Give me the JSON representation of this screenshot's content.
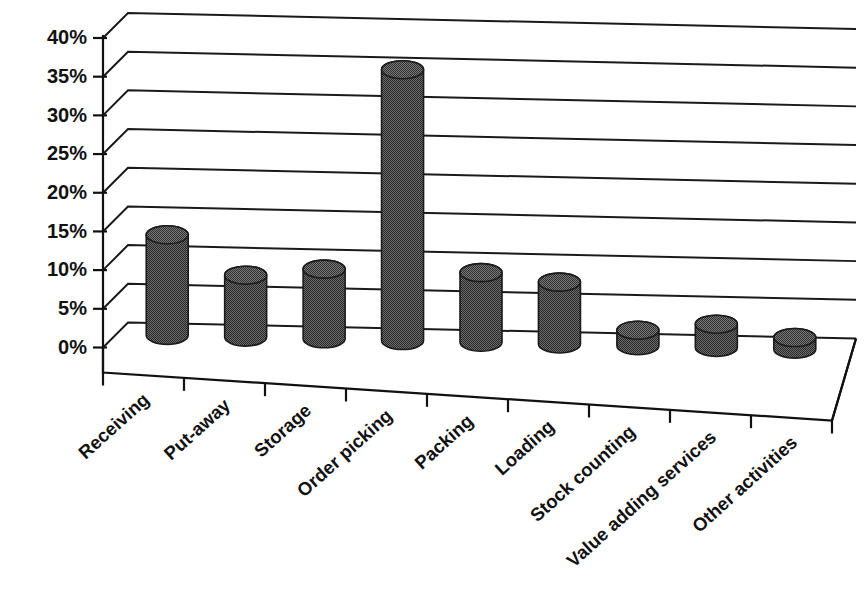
{
  "chart_data": {
    "type": "bar",
    "title": "",
    "subtitle": "",
    "xlabel": "",
    "ylabel": "",
    "categories": [
      "Receiving",
      "Put-away",
      "Storage",
      "Order picking",
      "Packing",
      "Loading",
      "Stock counting",
      "Value adding services",
      "Other activities"
    ],
    "values": [
      13,
      8,
      9,
      35,
      9,
      8,
      2,
      3,
      1.5
    ],
    "value_labels": [
      "13%",
      "8%",
      "9%",
      "35%",
      "9%",
      "8%",
      "2%",
      "3%",
      "1.5%"
    ],
    "ylim": [
      0,
      40
    ],
    "ytick_labels": [
      "0%",
      "5%",
      "10%",
      "15%",
      "20%",
      "25%",
      "30%",
      "35%",
      "40%"
    ],
    "ytick_values": [
      0,
      5,
      10,
      15,
      20,
      25,
      30,
      35,
      40
    ],
    "grid": true,
    "legend": false,
    "legend_position": "none",
    "style": "3d-cylinder",
    "series_name": "Share of warehouse activity time",
    "bar_color": "#4a4a4a",
    "bar_outline_color": "#1b1b1b",
    "axis_color": "#111111",
    "background_color": "#ffffff"
  },
  "footer": {
    "smudge_text": ""
  }
}
